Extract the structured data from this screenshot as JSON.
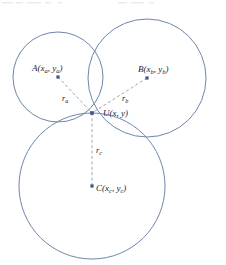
{
  "figure": {
    "type": "geometry-diagram",
    "background_color": "#ffffff",
    "circle_stroke_color": "#6e86ac",
    "radius_line_color": "#8e9bb5",
    "center_dot_color": "#3c5685",
    "label_color": "#1b2430"
  },
  "circles": [
    {
      "id": "circle-a",
      "center_label": "A",
      "center_sub_x": "a",
      "center_sub_y": "a",
      "label_text": "A(x",
      "label_mid": ", y",
      "label_end": ")",
      "cx": 58,
      "cy": 77,
      "r": 45
    },
    {
      "id": "circle-b",
      "center_label": "B",
      "center_sub_x": "b",
      "center_sub_y": "b",
      "label_text": "B(x",
      "label_mid": ", y",
      "label_end": ")",
      "cx": 147,
      "cy": 78,
      "r": 59
    },
    {
      "id": "circle-c",
      "center_label": "C",
      "center_sub_x": "c",
      "center_sub_y": "c",
      "label_text": "C(x",
      "label_mid": ", y",
      "label_end": ")",
      "cx": 92,
      "cy": 186,
      "r": 73
    }
  ],
  "intersection_point": {
    "id": "point-u",
    "label_text": "U(x, y)",
    "x": 92,
    "y": 113
  },
  "radii": [
    {
      "id": "radius-a",
      "label_base": "r",
      "label_sub": "a",
      "from": "A",
      "to": "U"
    },
    {
      "id": "radius-b",
      "label_base": "r",
      "label_sub": "b",
      "from": "B",
      "to": "U"
    },
    {
      "id": "radius-c",
      "label_base": "r",
      "label_sub": "c",
      "from": "C",
      "to": "U"
    }
  ],
  "labels": {
    "a_point": {
      "base": "A(x",
      "sub1": "a",
      "mid": ", y",
      "sub2": "a",
      "end": ")"
    },
    "b_point": {
      "base": "B(x",
      "sub1": "b",
      "mid": ", y",
      "sub2": "b",
      "end": ")"
    },
    "c_point": {
      "base": "C(x",
      "sub1": "c",
      "mid": ", y",
      "sub2": "c",
      "end": ")"
    },
    "u_point": {
      "full": "U(x, y)"
    },
    "r_a": {
      "base": "r",
      "sub": "a"
    },
    "r_b": {
      "base": "r",
      "sub": "b"
    },
    "r_c": {
      "base": "r",
      "sub": "c"
    }
  }
}
